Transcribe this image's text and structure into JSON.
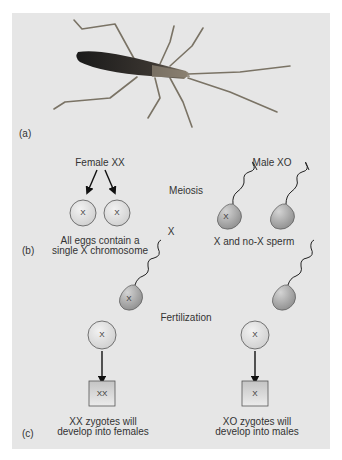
{
  "figure": {
    "panel_a": {
      "label": "(a)",
      "image": "insect-photo"
    },
    "panel_b": {
      "label": "(b)",
      "female_title": "Female XX",
      "male_title": "Male XO",
      "process_label": "Meiosis",
      "cross_symbol": "X",
      "eggs": [
        {
          "chromosome": "X"
        },
        {
          "chromosome": "X"
        }
      ],
      "sperm": [
        {
          "chromosome": "X"
        },
        {
          "chromosome": ""
        }
      ],
      "eggs_caption": "All eggs contain a\nsingle X chromosome",
      "sperm_caption": "X and no-X sperm"
    },
    "panel_c": {
      "label": "(c)",
      "process_label": "Fertilization",
      "left": {
        "egg_chromosome": "X",
        "sperm_chromosome": "X",
        "zygote": "XX",
        "caption": "XX zygotes will\ndevelop into females"
      },
      "right": {
        "egg_chromosome": "X",
        "sperm_chromosome": "",
        "zygote": "X",
        "caption": "XO zygotes will\ndevelop into males"
      }
    },
    "colors": {
      "background": "#e6e6e6",
      "cell_fill": "#dcdcdc",
      "sperm_fill": "#b5b5b5",
      "text": "#333333",
      "insect_body": "#2a2a2a",
      "insect_legs": "#7a7365"
    }
  }
}
